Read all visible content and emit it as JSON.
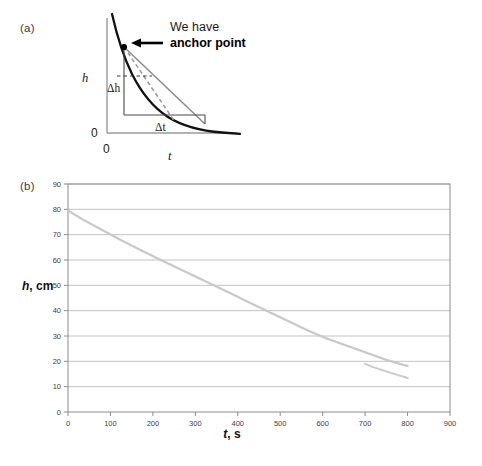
{
  "figure": {
    "panel_a": {
      "label": "(a)",
      "annotation_line1": "We have",
      "annotation_line2": "anchor point",
      "y_axis_label": "h",
      "x_axis_label": "t",
      "y_origin_label": "0",
      "x_origin_label": "0",
      "delta_h_label": "Δh",
      "delta_t_label": "Δt",
      "colors": {
        "curve": "#111111",
        "secant": "#8a8a8a",
        "tangent_dashed": "#9a9a9a",
        "axis": "#9a9a9a",
        "box": "#4a4a4a",
        "arrow": "#000000",
        "anchor_point": "#000000"
      }
    },
    "panel_b": {
      "label": "(b)",
      "colors": {
        "series": "#c9c9c9",
        "grid": "#b4b4b4",
        "frame": "#8c8c8c",
        "text": "#404040"
      }
    }
  },
  "chart_data": {
    "type": "scatter",
    "title": "",
    "xlabel": "t, s",
    "xlabel_italic_part": "t",
    "xlabel_rest": ", s",
    "ylabel": "h, cm",
    "ylabel_italic_part": "h",
    "ylabel_rest": ", cm",
    "xlim": [
      0,
      900
    ],
    "ylim": [
      0,
      90
    ],
    "xticks": [
      0,
      100,
      200,
      300,
      400,
      500,
      600,
      700,
      800,
      900
    ],
    "yticks": [
      0,
      10,
      20,
      30,
      40,
      50,
      60,
      70,
      80,
      90
    ],
    "grid": "horizontal",
    "legend": "none",
    "marker": "small-square-dotted",
    "series": [
      {
        "name": "h vs t",
        "x": [
          0,
          10,
          20,
          30,
          40,
          50,
          60,
          70,
          80,
          90,
          100,
          110,
          120,
          130,
          140,
          150,
          160,
          170,
          180,
          190,
          200,
          210,
          220,
          230,
          240,
          250,
          260,
          270,
          280,
          290,
          300,
          310,
          320,
          330,
          340,
          350,
          360,
          370,
          380,
          390,
          400,
          410,
          420,
          430,
          440,
          450,
          460,
          470,
          480,
          490,
          500,
          510,
          520,
          530,
          540,
          550,
          560,
          570,
          580,
          590,
          600,
          610,
          620,
          630,
          640,
          650,
          660,
          670,
          680,
          690,
          700,
          710,
          720,
          730,
          740,
          750,
          760,
          770,
          780,
          790,
          800
        ],
        "y": [
          79.5,
          78.5,
          77.5,
          76.5,
          75.5,
          74.6,
          73.7,
          72.8,
          71.9,
          71.0,
          70.1,
          69.2,
          68.3,
          67.4,
          66.6,
          65.7,
          64.9,
          64.0,
          63.2,
          62.4,
          61.6,
          60.7,
          59.9,
          59.1,
          58.3,
          57.5,
          56.7,
          55.9,
          55.1,
          54.3,
          53.5,
          52.7,
          51.9,
          51.1,
          50.3,
          49.5,
          48.7,
          47.9,
          47.1,
          46.3,
          45.5,
          44.6,
          43.8,
          43.0,
          42.2,
          41.4,
          40.6,
          39.8,
          39.0,
          38.2,
          37.4,
          36.6,
          35.8,
          35.0,
          34.2,
          33.4,
          32.6,
          31.8,
          31.1,
          30.4,
          29.7,
          29.0,
          28.4,
          27.8,
          27.2,
          26.6,
          26.0,
          25.4,
          24.8,
          24.2,
          23.6,
          23.0,
          22.4,
          21.8,
          21.2,
          20.6,
          20.1,
          19.6,
          19.1,
          18.6,
          18.2
        ]
      }
    ],
    "extra_tail": {
      "note": "flattening tail of markers",
      "x": [
        700,
        715,
        730,
        745,
        760,
        775,
        790,
        800
      ],
      "y": [
        19.0,
        18.0,
        17.1,
        16.3,
        15.5,
        14.7,
        14.0,
        13.4
      ]
    }
  }
}
